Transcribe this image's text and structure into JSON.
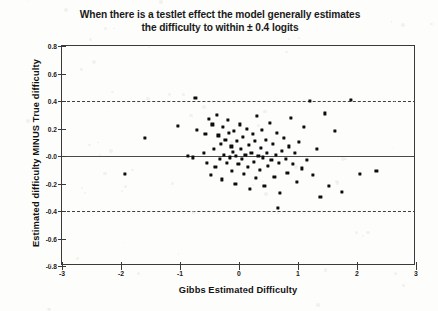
{
  "chart_data": {
    "type": "scatter",
    "title": "When there is a testlet effect the model generally estimates the difficulty to within  ± 0.4 logits",
    "title_line1": "When there is a testlet effect the model generally estimates",
    "title_line2": "the difficulty to within  ± 0.4 logits",
    "xlabel": "Gibbs Estimated Difficulty",
    "ylabel": "Estimated difficulty MINUS True difficulty",
    "xlim": [
      -3,
      3
    ],
    "ylim": [
      -0.8,
      0.8
    ],
    "xticks": [
      -3,
      -2,
      -1,
      0,
      1,
      2,
      3
    ],
    "xtick_labels": [
      "-3",
      "-2",
      "-1",
      "0",
      "1",
      "2",
      "3"
    ],
    "yticks": [
      -0.8,
      -0.6,
      -0.4,
      -0.2,
      0.0,
      0.2,
      0.4,
      0.6,
      0.8
    ],
    "ytick_labels": [
      "-0.8",
      "-0.6",
      "-0.4",
      "-0.2",
      "-0.0",
      "0.2",
      "0.4",
      "0.6",
      "0.8"
    ],
    "grid": false,
    "legend": null,
    "reference_lines": [
      {
        "name": "zero-line",
        "y": 0.0,
        "style": "solid",
        "color": "#4a4a4a"
      },
      {
        "name": "upper-tolerance-line",
        "y": 0.4,
        "style": "dashed",
        "color": "#3f3f3f"
      },
      {
        "name": "lower-tolerance-line",
        "y": -0.4,
        "style": "dashed",
        "color": "#3f3f3f"
      }
    ],
    "marker": {
      "shape": "square",
      "color": "#0d0d0d",
      "size_px": 3.2
    },
    "n_points": 92,
    "points": [
      [
        -1.93,
        -0.13
      ],
      [
        -1.6,
        0.13
      ],
      [
        -1.03,
        0.22
      ],
      [
        -0.87,
        0.0
      ],
      [
        -0.78,
        -0.01
      ],
      [
        -0.74,
        0.42
      ],
      [
        -0.71,
        0.19
      ],
      [
        -0.6,
        0.02
      ],
      [
        -0.57,
        0.16
      ],
      [
        -0.54,
        -0.05
      ],
      [
        -0.51,
        0.27
      ],
      [
        -0.47,
        -0.14
      ],
      [
        -0.45,
        0.23
      ],
      [
        -0.42,
        0.05
      ],
      [
        -0.4,
        -0.08
      ],
      [
        -0.37,
        0.3
      ],
      [
        -0.35,
        0.15
      ],
      [
        -0.33,
        -0.02
      ],
      [
        -0.31,
        0.09
      ],
      [
        -0.29,
        -0.17
      ],
      [
        -0.27,
        0.21
      ],
      [
        -0.25,
        0.01
      ],
      [
        -0.23,
        0.12
      ],
      [
        -0.21,
        -0.05
      ],
      [
        -0.19,
        0.26
      ],
      [
        -0.17,
        0.17
      ],
      [
        -0.15,
        -0.01
      ],
      [
        -0.13,
        0.07
      ],
      [
        -0.12,
        -0.11
      ],
      [
        -0.1,
        0.03
      ],
      [
        -0.08,
        0.18
      ],
      [
        -0.06,
        -0.2
      ],
      [
        -0.05,
        0.0
      ],
      [
        -0.03,
        0.11
      ],
      [
        -0.01,
        -0.06
      ],
      [
        0.01,
        0.23
      ],
      [
        0.03,
        0.05
      ],
      [
        0.05,
        -0.02
      ],
      [
        0.07,
        0.14
      ],
      [
        0.09,
        -0.13
      ],
      [
        0.11,
        0.01
      ],
      [
        0.13,
        0.2
      ],
      [
        0.15,
        -0.08
      ],
      [
        0.17,
        0.08
      ],
      [
        0.19,
        -0.24
      ],
      [
        0.21,
        0.02
      ],
      [
        0.23,
        0.16
      ],
      [
        0.25,
        -0.04
      ],
      [
        0.27,
        0.11
      ],
      [
        0.29,
        -0.16
      ],
      [
        0.31,
        0.29
      ],
      [
        0.33,
        0.0
      ],
      [
        0.35,
        -0.1
      ],
      [
        0.37,
        0.06
      ],
      [
        0.39,
        0.19
      ],
      [
        0.41,
        -0.01
      ],
      [
        0.43,
        -0.22
      ],
      [
        0.45,
        0.12
      ],
      [
        0.47,
        0.02
      ],
      [
        0.49,
        -0.07
      ],
      [
        0.52,
        0.24
      ],
      [
        0.55,
        -0.03
      ],
      [
        0.57,
        0.09
      ],
      [
        0.6,
        -0.15
      ],
      [
        0.62,
        0.01
      ],
      [
        0.64,
        0.17
      ],
      [
        0.67,
        -0.05
      ],
      [
        0.7,
        -0.27
      ],
      [
        0.73,
        0.04
      ],
      [
        0.76,
        0.13
      ],
      [
        0.79,
        -0.02
      ],
      [
        0.82,
        -0.12
      ],
      [
        0.85,
        0.07
      ],
      [
        0.88,
        0.28
      ],
      [
        0.92,
        -0.06
      ],
      [
        0.95,
        0.02
      ],
      [
        0.98,
        -0.19
      ],
      [
        1.02,
        0.1
      ],
      [
        1.06,
        -0.09
      ],
      [
        1.1,
        0.21
      ],
      [
        1.15,
        -0.03
      ],
      [
        1.2,
        0.4
      ],
      [
        1.25,
        -0.14
      ],
      [
        1.32,
        0.05
      ],
      [
        1.38,
        -0.3
      ],
      [
        1.45,
        0.31
      ],
      [
        1.52,
        -0.22
      ],
      [
        1.62,
        0.18
      ],
      [
        1.75,
        -0.26
      ],
      [
        1.9,
        0.41
      ],
      [
        2.05,
        -0.13
      ],
      [
        2.33,
        -0.11
      ],
      [
        0.66,
        -0.38
      ]
    ]
  },
  "axes": {
    "x_title": "Gibbs Estimated Difficulty",
    "y_title": "Estimated difficulty MINUS True difficulty"
  }
}
